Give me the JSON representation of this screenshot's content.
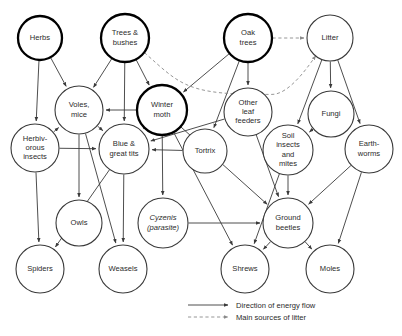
{
  "diagram": {
    "type": "food-web",
    "nodes": [
      {
        "id": "herbs",
        "label": [
          "Herbs"
        ],
        "cx": 40,
        "cy": 38,
        "r": 22,
        "emphasis": "thick"
      },
      {
        "id": "trees_bushes",
        "label": [
          "Trees &",
          "bushes"
        ],
        "cx": 125,
        "cy": 38,
        "r": 24,
        "emphasis": "thick"
      },
      {
        "id": "oak_trees",
        "label": [
          "Oak",
          "trees"
        ],
        "cx": 248,
        "cy": 38,
        "r": 24,
        "emphasis": "thick"
      },
      {
        "id": "litter",
        "label": [
          "Litter"
        ],
        "cx": 330,
        "cy": 38,
        "r": 23,
        "emphasis": "thin"
      },
      {
        "id": "voles_mice",
        "label": [
          "Voles,",
          "mice"
        ],
        "cx": 79,
        "cy": 110,
        "r": 24,
        "emphasis": "thin"
      },
      {
        "id": "winter_moth",
        "label": [
          "Winter",
          "moth"
        ],
        "cx": 162,
        "cy": 110,
        "r": 25,
        "emphasis": "thick"
      },
      {
        "id": "other_leaf_feeders",
        "label": [
          "Other",
          "leaf",
          "feeders"
        ],
        "cx": 248,
        "cy": 112,
        "r": 24,
        "emphasis": "thin"
      },
      {
        "id": "fungi",
        "label": [
          "Fungi"
        ],
        "cx": 331,
        "cy": 114,
        "r": 23,
        "emphasis": "thin"
      },
      {
        "id": "herbivorous_insects",
        "label": [
          "Herbiv-",
          "orous",
          "insects"
        ],
        "cx": 35,
        "cy": 148,
        "r": 24,
        "emphasis": "thin"
      },
      {
        "id": "blue_great_tits",
        "label": [
          "Blue &",
          "great tits"
        ],
        "cx": 124,
        "cy": 149,
        "r": 25,
        "emphasis": "thin"
      },
      {
        "id": "tortrix",
        "label": [
          "Tortrix"
        ],
        "cx": 205,
        "cy": 151,
        "r": 22,
        "emphasis": "thin"
      },
      {
        "id": "soil_insects_mites",
        "label": [
          "Soil",
          "insects",
          "and",
          "mites"
        ],
        "cx": 288,
        "cy": 150,
        "r": 25,
        "emphasis": "thin"
      },
      {
        "id": "earthworms",
        "label": [
          "Earth-",
          "worms"
        ],
        "cx": 369,
        "cy": 149,
        "r": 24,
        "emphasis": "thin"
      },
      {
        "id": "owls",
        "label": [
          "Owls"
        ],
        "cx": 79,
        "cy": 223,
        "r": 23,
        "emphasis": "thin"
      },
      {
        "id": "cyzenis",
        "label": [
          "Cyzenis",
          "(parasite)"
        ],
        "cx": 163,
        "cy": 223,
        "r": 25,
        "emphasis": "thin",
        "italic": true
      },
      {
        "id": "ground_beetles",
        "label": [
          "Ground",
          "beetles"
        ],
        "cx": 288,
        "cy": 223,
        "r": 25,
        "emphasis": "thin"
      },
      {
        "id": "spiders",
        "label": [
          "Spiders"
        ],
        "cx": 40,
        "cy": 269,
        "r": 24,
        "emphasis": "thin"
      },
      {
        "id": "weasels",
        "label": [
          "Weasels"
        ],
        "cx": 123,
        "cy": 269,
        "r": 24,
        "emphasis": "thin"
      },
      {
        "id": "shrews",
        "label": [
          "Shrews"
        ],
        "cx": 245,
        "cy": 269,
        "r": 24,
        "emphasis": "thin"
      },
      {
        "id": "moles",
        "label": [
          "Moles"
        ],
        "cx": 330,
        "cy": 269,
        "r": 24,
        "emphasis": "thin"
      }
    ],
    "energy_flows": [
      {
        "from": "herbs",
        "to": "voles_mice"
      },
      {
        "from": "herbs",
        "to": "herbivorous_insects"
      },
      {
        "from": "trees_bushes",
        "to": "voles_mice"
      },
      {
        "from": "trees_bushes",
        "to": "blue_great_tits"
      },
      {
        "from": "trees_bushes",
        "to": "winter_moth"
      },
      {
        "from": "oak_trees",
        "to": "winter_moth"
      },
      {
        "from": "oak_trees",
        "to": "other_leaf_feeders"
      },
      {
        "from": "oak_trees",
        "to": "tortrix"
      },
      {
        "from": "litter",
        "to": "fungi"
      },
      {
        "from": "litter",
        "to": "soil_insects_mites"
      },
      {
        "from": "litter",
        "to": "earthworms"
      },
      {
        "from": "fungi",
        "to": "soil_insects_mites"
      },
      {
        "from": "winter_moth",
        "to": "voles_mice"
      },
      {
        "from": "winter_moth",
        "to": "blue_great_tits"
      },
      {
        "from": "winter_moth",
        "to": "cyzenis"
      },
      {
        "from": "winter_moth",
        "to": "ground_beetles"
      },
      {
        "from": "winter_moth",
        "to": "shrews"
      },
      {
        "from": "tortrix",
        "to": "blue_great_tits"
      },
      {
        "from": "other_leaf_feeders",
        "to": "blue_great_tits"
      },
      {
        "from": "other_leaf_feeders",
        "to": "ground_beetles"
      },
      {
        "from": "herbivorous_insects",
        "to": "voles_mice"
      },
      {
        "from": "herbivorous_insects",
        "to": "blue_great_tits"
      },
      {
        "from": "herbivorous_insects",
        "to": "spiders"
      },
      {
        "from": "voles_mice",
        "to": "owls"
      },
      {
        "from": "voles_mice",
        "to": "weasels"
      },
      {
        "from": "voles_mice",
        "to": "blue_great_tits"
      },
      {
        "from": "blue_great_tits",
        "to": "weasels"
      },
      {
        "from": "blue_great_tits",
        "to": "spiders"
      },
      {
        "from": "soil_insects_mites",
        "to": "ground_beetles"
      },
      {
        "from": "soil_insects_mites",
        "to": "shrews"
      },
      {
        "from": "earthworms",
        "to": "ground_beetles"
      },
      {
        "from": "earthworms",
        "to": "moles"
      },
      {
        "from": "ground_beetles",
        "to": "shrews"
      },
      {
        "from": "ground_beetles",
        "to": "moles"
      },
      {
        "from": "cyzenis",
        "to": "ground_beetles"
      }
    ],
    "litter_sources": [
      {
        "from": "oak_trees",
        "to": "litter"
      },
      {
        "from": "trees_bushes",
        "to": "litter"
      }
    ]
  },
  "legend": {
    "items": [
      {
        "style": "solid",
        "label": "Direction of energy flow"
      },
      {
        "style": "dashed",
        "label": "Main sources of litter"
      }
    ]
  }
}
